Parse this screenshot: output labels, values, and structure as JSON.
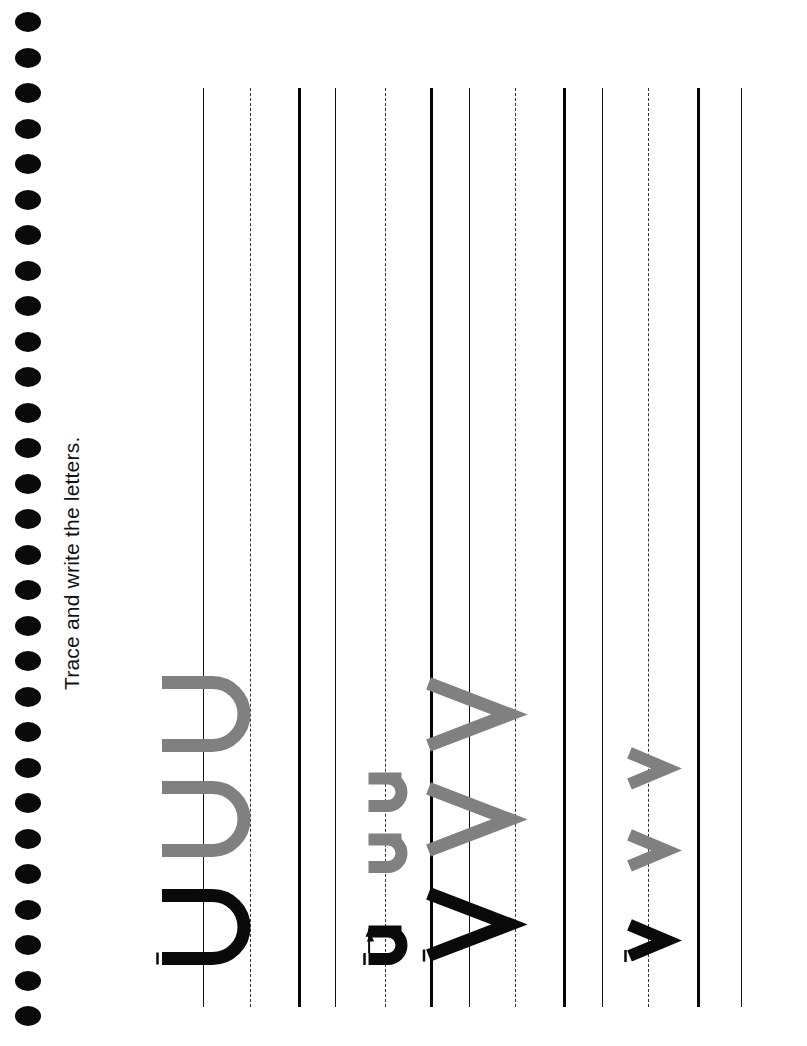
{
  "page": {
    "width": 807,
    "height": 1046,
    "background": "#ffffff",
    "orientation": "landscape-rotated-90ccw",
    "type": "handwriting-tracing-worksheet"
  },
  "binding": {
    "name": "spiral-binding-holes",
    "hole_count": 29,
    "hole_color": "#0a0a0a",
    "hole_width": 26,
    "hole_height": 20,
    "first_hole_y": 12,
    "spacing": 35.5,
    "left": 15
  },
  "instruction": {
    "text": "Trace and write the letters.",
    "rotation_deg": -90,
    "color": "#111111",
    "font_size": 21
  },
  "colors": {
    "ink_black": "#0a0a0a",
    "trace_gray": "#808080",
    "rule_line": "#111111",
    "rule_dashed": "#333333",
    "paper": "#ffffff"
  },
  "rules": {
    "top_y": 88,
    "bottom_y": 1007,
    "height": 919,
    "description": "Each writing band has a thin top line, a dashed midline and a thick baseline.",
    "bands": [
      {
        "name": "band-1",
        "letter": "U",
        "top_line_x": 203,
        "mid_dash_x": 250,
        "baseline_x": 298
      },
      {
        "name": "band-2",
        "letter": "u",
        "top_line_x": 335,
        "mid_dash_x": 385,
        "baseline_x": 430
      },
      {
        "name": "band-3",
        "letter": "V",
        "top_line_x": 469,
        "mid_dash_x": 515,
        "baseline_x": 563
      },
      {
        "name": "band-4",
        "letter": "v",
        "top_line_x": 602,
        "mid_dash_x": 648,
        "baseline_x": 697
      }
    ],
    "trailing_line_x": 741
  },
  "letter_rows": [
    {
      "name": "row-uppercase-u",
      "letter": "U",
      "case": "uppercase",
      "band": "band-1",
      "occupies": "full-height",
      "items": [
        {
          "style": "model",
          "color": "#0a0a0a",
          "has_arrows": true,
          "has_start_dot": true,
          "center_y": 965
        },
        {
          "style": "trace",
          "color": "#808080",
          "has_arrows": false,
          "has_start_dot": false,
          "center_y": 857
        },
        {
          "style": "trace",
          "color": "#808080",
          "has_arrows": false,
          "has_start_dot": false,
          "center_y": 752
        }
      ],
      "stroke_count": 1,
      "stroke_hint": "Down, curve around, up"
    },
    {
      "name": "row-lowercase-u",
      "letter": "u",
      "case": "lowercase",
      "band": "band-2",
      "occupies": "x-height",
      "items": [
        {
          "style": "model",
          "color": "#0a0a0a",
          "has_arrows": true,
          "has_start_dot": true,
          "center_y": 965
        },
        {
          "style": "trace",
          "color": "#808080",
          "has_arrows": false,
          "has_start_dot": false,
          "center_y": 873
        },
        {
          "style": "trace",
          "color": "#808080",
          "has_arrows": false,
          "has_start_dot": false,
          "center_y": 812
        }
      ],
      "stroke_count": 2,
      "stroke_hint": "Down, curve, up; then down"
    },
    {
      "name": "row-uppercase-v",
      "letter": "V",
      "case": "uppercase",
      "band": "band-3",
      "occupies": "full-height",
      "items": [
        {
          "style": "model",
          "color": "#0a0a0a",
          "has_arrows": true,
          "has_start_dot": true,
          "center_y": 962
        },
        {
          "style": "trace",
          "color": "#808080",
          "has_arrows": false,
          "has_start_dot": false,
          "center_y": 857
        },
        {
          "style": "trace",
          "color": "#808080",
          "has_arrows": false,
          "has_start_dot": false,
          "center_y": 752
        }
      ],
      "stroke_count": 2,
      "stroke_hint": "Slant down, slant up"
    },
    {
      "name": "row-lowercase-v",
      "letter": "v",
      "case": "lowercase",
      "band": "band-4",
      "occupies": "x-height",
      "items": [
        {
          "style": "model",
          "color": "#0a0a0a",
          "has_arrows": true,
          "has_start_dot": true,
          "center_y": 962
        },
        {
          "style": "trace",
          "color": "#808080",
          "has_arrows": false,
          "has_start_dot": false,
          "center_y": 872
        },
        {
          "style": "trace",
          "color": "#808080",
          "has_arrows": false,
          "has_start_dot": false,
          "center_y": 790
        }
      ],
      "stroke_count": 2,
      "stroke_hint": "Slant down, slant up"
    }
  ]
}
